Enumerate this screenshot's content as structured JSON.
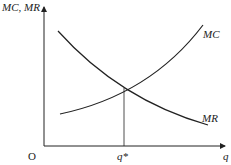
{
  "diagram": {
    "y_axis_label": "MC, MR",
    "x_axis_label": "q",
    "origin_label": "O",
    "equilibrium_label": "q*",
    "curves": [
      {
        "name": "MC",
        "label": "MC",
        "shape": "upward-sloping convex"
      },
      {
        "name": "MR",
        "label": "MR",
        "shape": "downward-sloping convex"
      }
    ],
    "line_color": "#222222"
  }
}
